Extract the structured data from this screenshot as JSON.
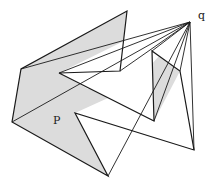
{
  "diagram": {
    "labels": {
      "polygon": "P",
      "point": "q"
    },
    "colors": {
      "fill": "#dcdcdc",
      "visible": "#ffffff",
      "stroke": "#1a1a1a"
    },
    "point_q": [
      190,
      22
    ],
    "polygon_vertices": [
      [
        127,
        11
      ],
      [
        120,
        71
      ],
      [
        59,
        73
      ],
      [
        154,
        121
      ],
      [
        152,
        51
      ],
      [
        180,
        71
      ],
      [
        194,
        150
      ],
      [
        75,
        113
      ],
      [
        108,
        176
      ],
      [
        12,
        122
      ],
      [
        21,
        69
      ]
    ],
    "visible_region": [
      [
        190,
        22
      ],
      [
        127,
        11
      ],
      [
        124,
        41
      ],
      [
        59,
        73
      ],
      [
        88,
        89
      ],
      [
        152,
        51
      ],
      [
        154,
        121
      ],
      [
        180,
        71
      ],
      [
        194,
        150
      ],
      [
        140,
        133
      ],
      [
        108,
        176
      ],
      [
        75,
        113
      ],
      [
        130,
        88
      ]
    ],
    "sight_lines": [
      [
        [
          190,
          22
        ],
        [
          21,
          69
        ]
      ],
      [
        [
          190,
          22
        ],
        [
          59,
          73
        ]
      ],
      [
        [
          190,
          22
        ],
        [
          120,
          71
        ]
      ],
      [
        [
          190,
          22
        ],
        [
          12,
          122
        ]
      ],
      [
        [
          190,
          22
        ],
        [
          108,
          176
        ]
      ],
      [
        [
          190,
          22
        ],
        [
          152,
          51
        ]
      ],
      [
        [
          190,
          22
        ],
        [
          180,
          71
        ]
      ],
      [
        [
          190,
          22
        ],
        [
          194,
          150
        ]
      ],
      [
        [
          190,
          22
        ],
        [
          154,
          121
        ]
      ]
    ]
  }
}
